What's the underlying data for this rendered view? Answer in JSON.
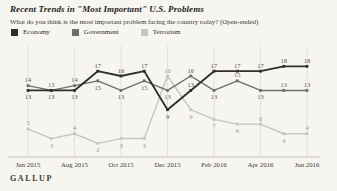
{
  "page": {
    "brand": "GALLUP"
  },
  "header": {
    "title": "Recent Trends in \"Most Important\" U.S. Problems",
    "subtitle": "What do you think is the most important problem facing the country today? (Open-ended)"
  },
  "legend": [
    {
      "label": "Economy",
      "color": "#2f2e2c"
    },
    {
      "label": "Government",
      "color": "#6f6e6b"
    },
    {
      "label": "Terrorism",
      "color": "#c7c5c0"
    }
  ],
  "chart_data": {
    "type": "line",
    "x": [
      "Jun 2015",
      "Jul 2015",
      "Aug 2015",
      "Sep 2015",
      "Oct 2015",
      "Nov 2015",
      "Dec 2015",
      "Jan 2016",
      "Feb 2016",
      "Mar 2016",
      "Apr 2016",
      "May 2016",
      "Jun 2016"
    ],
    "x_tick_labels": [
      "Jun 2015",
      "Aug 2015",
      "Oct 2015",
      "Dec 2015",
      "Feb 2016",
      "Apr 2016",
      "Jun 2016"
    ],
    "series": [
      {
        "name": "Economy",
        "color": "#2f2e2c",
        "values": [
          13,
          13,
          13,
          17,
          16,
          17,
          9,
          13,
          17,
          17,
          17,
          18,
          18
        ]
      },
      {
        "name": "Government",
        "color": "#6f6e6b",
        "values": [
          14,
          13,
          14,
          15,
          13,
          15,
          13,
          16,
          13,
          15,
          13,
          13,
          13
        ]
      },
      {
        "name": "Terrorism",
        "color": "#c7c5c0",
        "values": [
          5,
          3,
          4,
          2,
          3,
          3,
          16,
          9,
          7,
          6,
          6,
          4,
          4
        ]
      }
    ],
    "ylim": [
      0,
      20
    ],
    "grid": "vertical-every-2-months",
    "data_labels": true,
    "legend_position": "top",
    "source": "GALLUP"
  }
}
